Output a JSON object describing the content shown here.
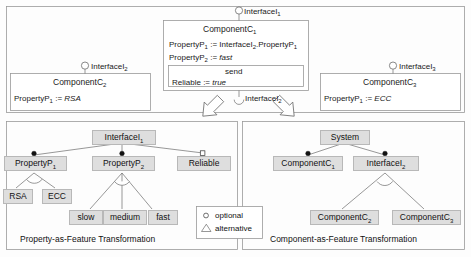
{
  "diagram": {
    "colors": {
      "feature_fill": "#dedede",
      "feature_stroke": "#b8b8b8",
      "panel_stroke": "#9a9a9a",
      "box_stroke": "#9a9a9a",
      "line": "#6b6b6b",
      "text": "#1a1a1a",
      "page_bg": "#fdfdfd"
    }
  },
  "top_panel": {
    "name": "component-model-panel",
    "interfaces": [
      {
        "id": "top-interface",
        "label": "InterfaceI",
        "sub": "1",
        "kind": "provided-lollipop"
      },
      {
        "id": "left-interface",
        "label": "InterfaceI",
        "sub": "2",
        "kind": "provided-lollipop"
      },
      {
        "id": "right-interface",
        "label": "InterfaceI",
        "sub": "3",
        "kind": "provided-lollipop"
      },
      {
        "id": "required-interface",
        "label": "InterfaceI",
        "sub": "2",
        "kind": "required-socket"
      }
    ],
    "center_component": {
      "name": "ComponentC",
      "sub": "1",
      "properties": [
        {
          "lhs": "PropertyP",
          "lhs_sub": "1",
          "op": ":=",
          "rhs": "InterfaceI",
          "rhs_sub": "2",
          "rhs_tail": ".PropertyP",
          "rhs_tail_sub": "1",
          "italic": false
        },
        {
          "lhs": "PropertyP",
          "lhs_sub": "2",
          "op": ":=",
          "rhs": "fast",
          "italic": true
        }
      ],
      "operation": {
        "name": "send",
        "properties": [
          {
            "lhs": "Reliable",
            "op": ":=",
            "rhs": "true",
            "italic": true
          }
        ]
      }
    },
    "left_component": {
      "name": "ComponentC",
      "sub": "2",
      "properties": [
        {
          "lhs": "PropertyP",
          "lhs_sub": "1",
          "op": ":=",
          "rhs": "RSA",
          "italic": true
        }
      ]
    },
    "right_component": {
      "name": "ComponentC",
      "sub": "3",
      "properties": [
        {
          "lhs": "PropertyP",
          "lhs_sub": "1",
          "op": ":=",
          "rhs": "ECC",
          "italic": true
        }
      ]
    }
  },
  "left_panel": {
    "caption": "Property-as-Feature Transformation",
    "root": {
      "label": "InterfaceI",
      "sub": "1"
    },
    "level1": [
      {
        "label": "PropertyP",
        "sub": "1",
        "decorator": "mandatory"
      },
      {
        "label": "PropertyP",
        "sub": "2",
        "decorator": "mandatory"
      },
      {
        "label": "Reliable",
        "sub": "",
        "decorator": "optional"
      }
    ],
    "group_p1": {
      "type": "alternative",
      "children": [
        {
          "label": "RSA"
        },
        {
          "label": "ECC"
        }
      ]
    },
    "group_p2": {
      "type": "alternative",
      "children": [
        {
          "label": "slow"
        },
        {
          "label": "medium"
        },
        {
          "label": "fast"
        }
      ]
    }
  },
  "right_panel": {
    "caption": "Component-as-Feature Transformation",
    "root": {
      "label": "System",
      "sub": ""
    },
    "level1": [
      {
        "label": "ComponentC",
        "sub": "1",
        "decorator": "mandatory"
      },
      {
        "label": "InterfaceI",
        "sub": "2",
        "decorator": "mandatory"
      }
    ],
    "group_i2": {
      "type": "alternative",
      "children": [
        {
          "label": "ComponentC",
          "sub": "2"
        },
        {
          "label": "ComponentC",
          "sub": "3"
        }
      ]
    }
  },
  "legend": {
    "name": "legend-box",
    "items": [
      {
        "symbol": "optional-circle-icon",
        "label": "optional"
      },
      {
        "symbol": "alternative-triangle-icon",
        "label": "alternative"
      }
    ]
  }
}
